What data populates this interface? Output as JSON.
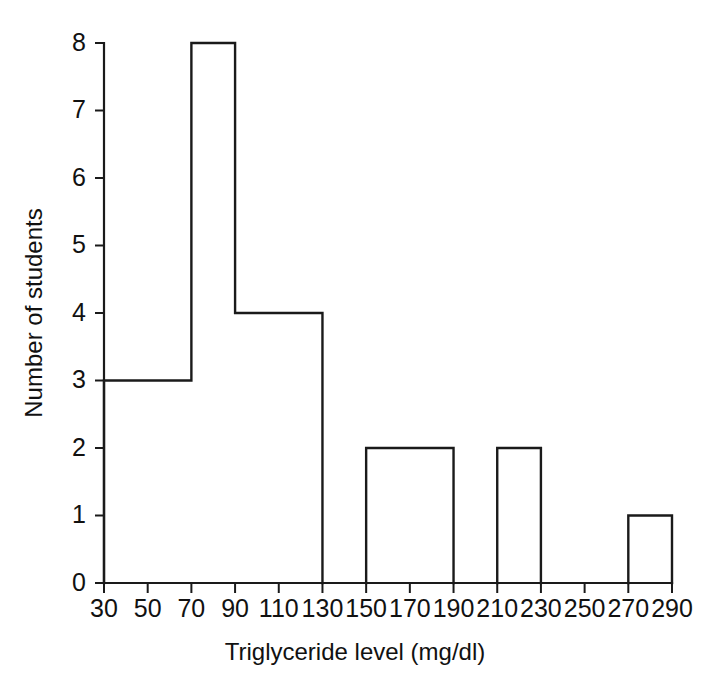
{
  "chart_data": {
    "type": "bar",
    "title": "",
    "subtitle": "",
    "xlabel": "Triglyceride level (mg/dl)",
    "ylabel": "Number of students",
    "xlim": [
      30,
      290
    ],
    "ylim": [
      0,
      8
    ],
    "grid": false,
    "legend": null,
    "bin_width": 20,
    "bin_edges": [
      30,
      50,
      70,
      90,
      110,
      130,
      150,
      170,
      190,
      210,
      230,
      250,
      270,
      290
    ],
    "categories": [
      "30-50",
      "50-70",
      "70-90",
      "90-110",
      "110-130",
      "130-150",
      "150-170",
      "170-190",
      "190-210",
      "210-230",
      "230-250",
      "250-270",
      "270-290"
    ],
    "values": [
      3,
      3,
      8,
      4,
      4,
      0,
      2,
      2,
      0,
      2,
      0,
      0,
      1
    ],
    "xticks": [
      30,
      50,
      70,
      90,
      110,
      130,
      150,
      170,
      190,
      210,
      230,
      250,
      270,
      290
    ],
    "xtick_labels": [
      "30",
      "50",
      "70",
      "90",
      "110",
      "130",
      "150",
      "170",
      "190",
      "210",
      "230",
      "250",
      "270",
      "290"
    ],
    "yticks": [
      0,
      1,
      2,
      3,
      4,
      5,
      6,
      7,
      8
    ],
    "ytick_labels": [
      "0",
      "1",
      "2",
      "3",
      "4",
      "5",
      "6",
      "7",
      "8"
    ],
    "colors": {
      "bar_stroke": "#1a1a1a",
      "bar_fill": "none",
      "axis": "#1a1a1a",
      "text": "#111111",
      "background": "#ffffff"
    }
  }
}
